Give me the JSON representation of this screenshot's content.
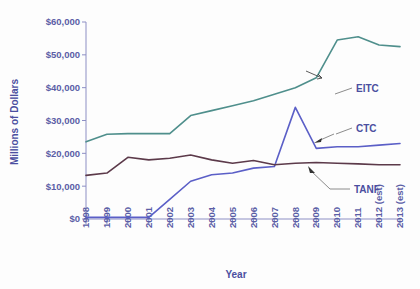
{
  "chart_data": {
    "type": "line",
    "title": "",
    "xlabel": "Year",
    "ylabel": "Millions of Dollars",
    "ylim": [
      0,
      60000
    ],
    "yticks": [
      0,
      10000,
      20000,
      30000,
      40000,
      50000,
      60000
    ],
    "ytick_labels": [
      "$0",
      "$10,000",
      "$20,000",
      "$30,000",
      "$40,000",
      "$50,000",
      "$60,000"
    ],
    "grid": false,
    "legend_position": "inline-annotations",
    "categories": [
      "1998",
      "1999",
      "2000",
      "2001",
      "2002",
      "2003",
      "2004",
      "2005",
      "2006",
      "2007",
      "2008",
      "2009",
      "2010",
      "2011",
      "2012 (est)",
      "2013 (est)"
    ],
    "series": [
      {
        "name": "EITC",
        "color": "#4f8f8c",
        "values": [
          23500,
          25800,
          26000,
          26000,
          26000,
          31500,
          33000,
          34500,
          36000,
          38000,
          40000,
          43000,
          54500,
          55500,
          53000,
          52500
        ]
      },
      {
        "name": "CTC",
        "color": "#5b5fc7",
        "values": [
          500,
          500,
          500,
          500,
          6000,
          11500,
          13500,
          14000,
          15500,
          16000,
          34000,
          21500,
          22000,
          22000,
          22500,
          23000
        ]
      },
      {
        "name": "TANF",
        "color": "#5c3a4a",
        "values": [
          13300,
          14000,
          18800,
          18000,
          18500,
          19500,
          18000,
          17000,
          17800,
          16500,
          17000,
          17200,
          17000,
          16800,
          16500,
          16500
        ]
      }
    ],
    "annotations": [
      {
        "label": "EITC",
        "target_series": "EITC"
      },
      {
        "label": "CTC",
        "target_series": "CTC"
      },
      {
        "label": "TANF",
        "target_series": "TANF"
      }
    ]
  },
  "axes": {
    "x_title": "Year",
    "y_title": "Millions of Dollars"
  }
}
